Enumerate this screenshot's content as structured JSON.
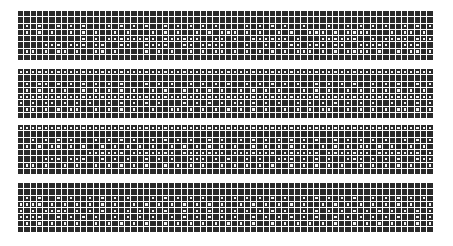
{
  "grid": {
    "columns": 66,
    "cell_color": "#2a2a2a",
    "dot_color": "#f4f4f4",
    "bands": [
      {
        "top": 11,
        "rows": [
          "000000000000000000000000000000000000000000000000000000000000000000",
          "000000000000000000000000000000000000000000000000000000000000000000",
          "010100101010001010101001010101010000101010100100010010101010010101",
          "010101001010100101000101010010101110101001010011101011110001011010",
          "000000000010101111111101111110011010011111101000111111001011110111",
          "000011101110110011001111001101111000100101011011101100111110011100",
          "011010110100110100001010100101011010101010101110101011110100101101",
          "000000000000000000000000000000000000000000000000000000000000000000"
        ]
      },
      {
        "top": 69,
        "rows": [
          "111111111111111111111111111111111111111111111111111111111111111111",
          "000000000000000000000000000000000000000000000000000000000000000000",
          "010110101010101010001010100101010100101010101001010101001010100101",
          "010101010010101010100101001010101001010101000101010010101010101010",
          "111111111111111111111111111111111111111111111111111111111111111111",
          "101011010101001010101010001010101011010101001010101010101001010101",
          "011010101100101010100100110101010101010100101010110010101010110101",
          "000000000000000000000000000000000000000000000000000000000000000000"
        ]
      },
      {
        "top": 125,
        "rows": [
          "111111111111111111111111111111111111111111111111111111111111111111",
          "000000000000000000000000000000000000000000000000000000000000000000",
          "001010101000101010100101010100101001010101010101001010101010010101",
          "010101101010010101010100101010101010010101010100101010110101001010",
          "000000000001111110111111101111111011111110111111011111110111111101",
          "000011101110010101001010100111010100101001110101010011101010100111",
          "011010010100101010101001010101001010101010010101010100101010101001",
          "000000000000000000000000000000000000000000000000000000000000000000"
        ]
      },
      {
        "top": 183,
        "rows": [
          "000000000000000000000000000000000000000000000000000000000000000000",
          "000000000000000000000000000000000000000000000000000000000000000000",
          "010100101001010101000101010101001010101010100101010101001010101010",
          "111101010101010100101010101010101001010101010100101010101010101001",
          "101011110101010101010101001010101010101010100101010101010101010101",
          "111100101010100101010100101010101010010101010101001010101010100101",
          "010101010100101010101001010101010101010010101010101001010101010101",
          "000000000000000000000000000000000000000000000000000000000000000000"
        ]
      }
    ]
  }
}
